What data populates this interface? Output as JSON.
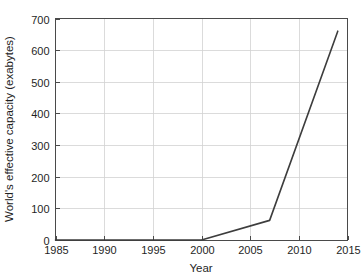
{
  "chart_data": {
    "type": "line",
    "title": "",
    "xlabel": "Year",
    "ylabel": "World's effective capacity (exabytes)",
    "xlim": [
      1985,
      2015
    ],
    "ylim": [
      0,
      700
    ],
    "xticks": [
      1985,
      1990,
      1995,
      2000,
      2005,
      2010,
      2015
    ],
    "xtick_labels": [
      "1985",
      "1990",
      "1995",
      "2000",
      "2005",
      "2010",
      "2015"
    ],
    "yticks": [
      0,
      100,
      200,
      300,
      400,
      500,
      600,
      700
    ],
    "ytick_labels": [
      "0",
      "100",
      "200",
      "300",
      "400",
      "500",
      "600",
      "700"
    ],
    "grid": true,
    "legend": null,
    "series": [
      {
        "name": "World's effective capacity",
        "color": "#3d3d3d",
        "x": [
          1985,
          2000,
          2007,
          2014
        ],
        "values": [
          0,
          0,
          62,
          660
        ]
      }
    ]
  },
  "style": {
    "background": "#ffffff",
    "grid_color": "#d2d2d2",
    "axis_color": "#4a4a4a",
    "text_color": "#1f1f1f",
    "line_color": "#3d3d3d"
  }
}
